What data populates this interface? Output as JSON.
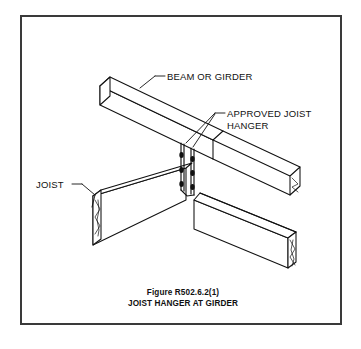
{
  "figure": {
    "caption_line1": "Figure R502.6.2(1)",
    "caption_line2": "JOIST HANGER AT GIRDER",
    "border_color": "#3a3a3a",
    "background_color": "#ffffff",
    "line_color": "#111111"
  },
  "labels": {
    "beam": "BEAM OR GIRDER",
    "hanger_line1": "APPROVED JOIST",
    "hanger_line2": "HANGER",
    "joist": "JOIST"
  },
  "diagram": {
    "type": "isometric-line-drawing",
    "members": [
      {
        "name": "beam-or-girder",
        "orientation": "upper-left to lower-right",
        "end_treatment_left": "open-end-face",
        "end_treatment_right": "hidden-behind-joist"
      },
      {
        "name": "joist-left-segment",
        "orientation": "lower-left to center",
        "end_treatment": "break-line-zigzag"
      },
      {
        "name": "joist-right-segment",
        "orientation": "center to lower-right",
        "end_treatment": "break-line-zigzag"
      }
    ],
    "hanger": {
      "name": "approved-joist-hanger",
      "strap_count": 2,
      "nail_columns": 2,
      "nails_per_column": 3,
      "total_nails": 6
    }
  }
}
